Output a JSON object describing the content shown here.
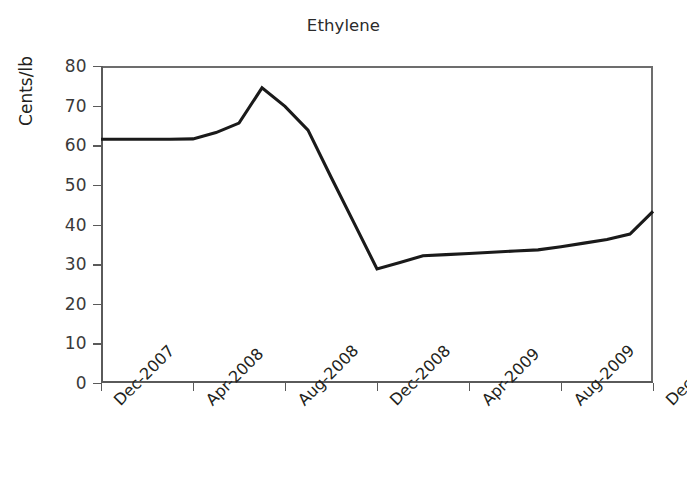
{
  "chart_data": {
    "type": "line",
    "title": "Ethylene",
    "xlabel": "",
    "ylabel": "Cents/lb",
    "ylim": [
      0,
      80
    ],
    "yticks": [
      0,
      10,
      20,
      30,
      40,
      50,
      60,
      70,
      80
    ],
    "ytick_labels": [
      "0",
      "10",
      "20",
      "30",
      "40",
      "50",
      "60",
      "70",
      "80"
    ],
    "xtick_labels": [
      "Dec-2007",
      "Apr-2008",
      "Aug-2008",
      "Dec-2008",
      "Apr-2009",
      "Aug-2009",
      "Dec-2009"
    ],
    "grid": false,
    "legend": false,
    "x_axis_type": "monthly",
    "x_start": "Dec-2007",
    "x_end": "Dec-2009",
    "series": [
      {
        "name": "Ethylene",
        "color": "#1a1a1a",
        "x": [
          "Dec-2007",
          "Jan-2008",
          "Feb-2008",
          "Mar-2008",
          "Apr-2008",
          "May-2008",
          "Jun-2008",
          "Jul-2008",
          "Aug-2008",
          "Sep-2008",
          "Oct-2008",
          "Nov-2008",
          "Dec-2008",
          "Jan-2009",
          "Feb-2009",
          "Mar-2009",
          "Apr-2009",
          "May-2009",
          "Jun-2009",
          "Jul-2009",
          "Aug-2009",
          "Sep-2009",
          "Oct-2009",
          "Nov-2009",
          "Dec-2009"
        ],
        "values": [
          61.5,
          61.5,
          61.5,
          61.5,
          61.6,
          63.2,
          65.6,
          74.5,
          69.8,
          63.8,
          52.0,
          40.4,
          28.8,
          30.4,
          32.1,
          32.4,
          32.7,
          33.0,
          33.3,
          33.6,
          34.4,
          35.3,
          36.2,
          37.6,
          43.3
        ]
      }
    ],
    "annotations": []
  },
  "figure": {
    "title": "Ethylene",
    "y_axis_title": "Cents/lb",
    "background_color": "#ffffff",
    "axis_color": "#5a5a5a",
    "line_color": "#1a1a1a"
  }
}
